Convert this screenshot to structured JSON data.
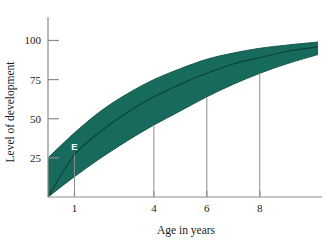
{
  "chart_data": {
    "type": "area",
    "title": "",
    "xlabel": "Age in years",
    "ylabel": "Level of development",
    "xlim": [
      0,
      10.2
    ],
    "ylim": [
      0,
      115
    ],
    "grid": false,
    "legend": null,
    "x_ticks": [
      1,
      4,
      6,
      8
    ],
    "x_tick_labels": [
      "1",
      "4",
      "6",
      "8"
    ],
    "y_ticks": [
      25,
      50,
      75,
      100
    ],
    "y_tick_labels": [
      "25",
      "50",
      "75",
      "100"
    ],
    "band": {
      "name": "Range of normal development",
      "color": "#176b5d",
      "x": [
        0,
        1,
        2,
        3,
        4,
        5,
        6,
        7,
        8,
        9,
        10.2
      ],
      "upper": [
        25,
        41,
        55,
        66,
        75,
        82,
        88,
        92,
        95,
        97,
        99
      ],
      "lower": [
        0,
        13,
        25,
        36,
        46,
        55,
        64,
        72,
        79,
        85,
        91
      ]
    },
    "median": {
      "name": "Average level of development",
      "color": "#0c413a",
      "x": [
        0,
        1,
        2,
        3,
        4,
        5,
        6,
        7,
        8,
        9,
        10.2
      ],
      "y": [
        0,
        27,
        42,
        54,
        64,
        72,
        79,
        85,
        89,
        93,
        96
      ]
    },
    "annotations": [
      {
        "label": "E",
        "x": 1,
        "y": 27,
        "drop_line": true
      }
    ],
    "drop_lines": [
      {
        "x": 4,
        "y_top": 46
      },
      {
        "x": 6,
        "y_top": 64
      },
      {
        "x": 8,
        "y_top": 79
      }
    ]
  }
}
